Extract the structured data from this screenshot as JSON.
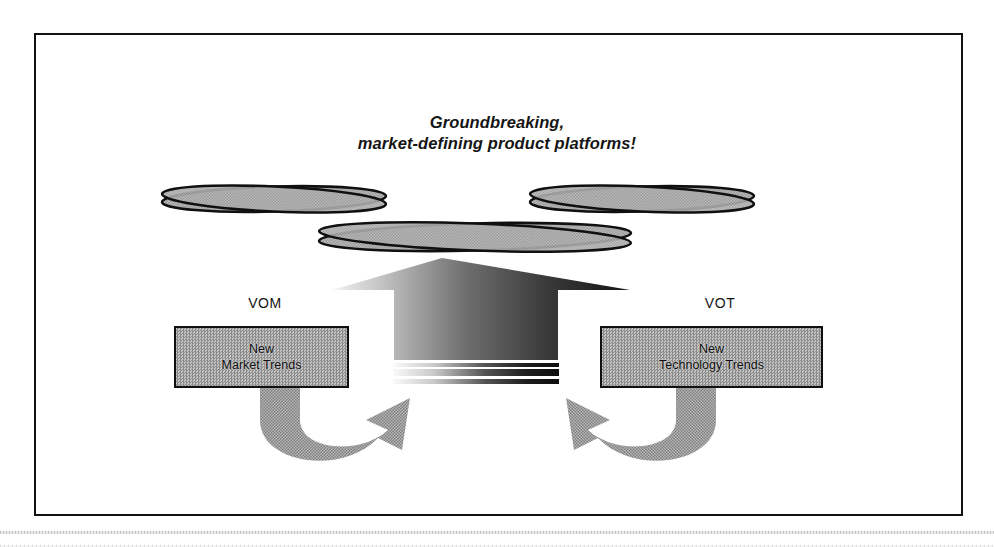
{
  "figure": {
    "headline": "Groundbreaking,\nmarket-defining product platforms!",
    "scan_artifact": true
  },
  "labels": {
    "left_source": "VOM",
    "right_source": "VOT"
  },
  "boxes": {
    "left": {
      "text": "New\nMarket Trends"
    },
    "right": {
      "text": "New\nTechnology Trends"
    }
  },
  "platform": {
    "element_count": 3,
    "shape": "crossed-ellipse-pair",
    "rows": [
      {
        "name": "platform-ellipse-top-left",
        "cx": 123,
        "cy": 27,
        "rx": 112,
        "ry": 13
      },
      {
        "name": "platform-ellipse-top-right",
        "cx": 492,
        "cy": 27,
        "rx": 112,
        "ry": 13
      },
      {
        "name": "platform-ellipse-bottom",
        "cx": 325,
        "cy": 65,
        "rx": 156,
        "ry": 14
      }
    ]
  },
  "flows": {
    "center_arrow": {
      "name": "upward-convergence-arrow",
      "direction": "up",
      "stripe_count": 3
    },
    "left_curve": {
      "name": "market-trend-feeder-arrow",
      "direction": "right"
    },
    "right_curve": {
      "name": "technology-trend-feeder-arrow",
      "direction": "left"
    }
  },
  "colors": {
    "ink": "#121212",
    "fill_gray": "#a3a3a3",
    "dither_dark": "#8c8c8c",
    "dither_light": "#c4c4c4",
    "page": "#ffffff"
  }
}
